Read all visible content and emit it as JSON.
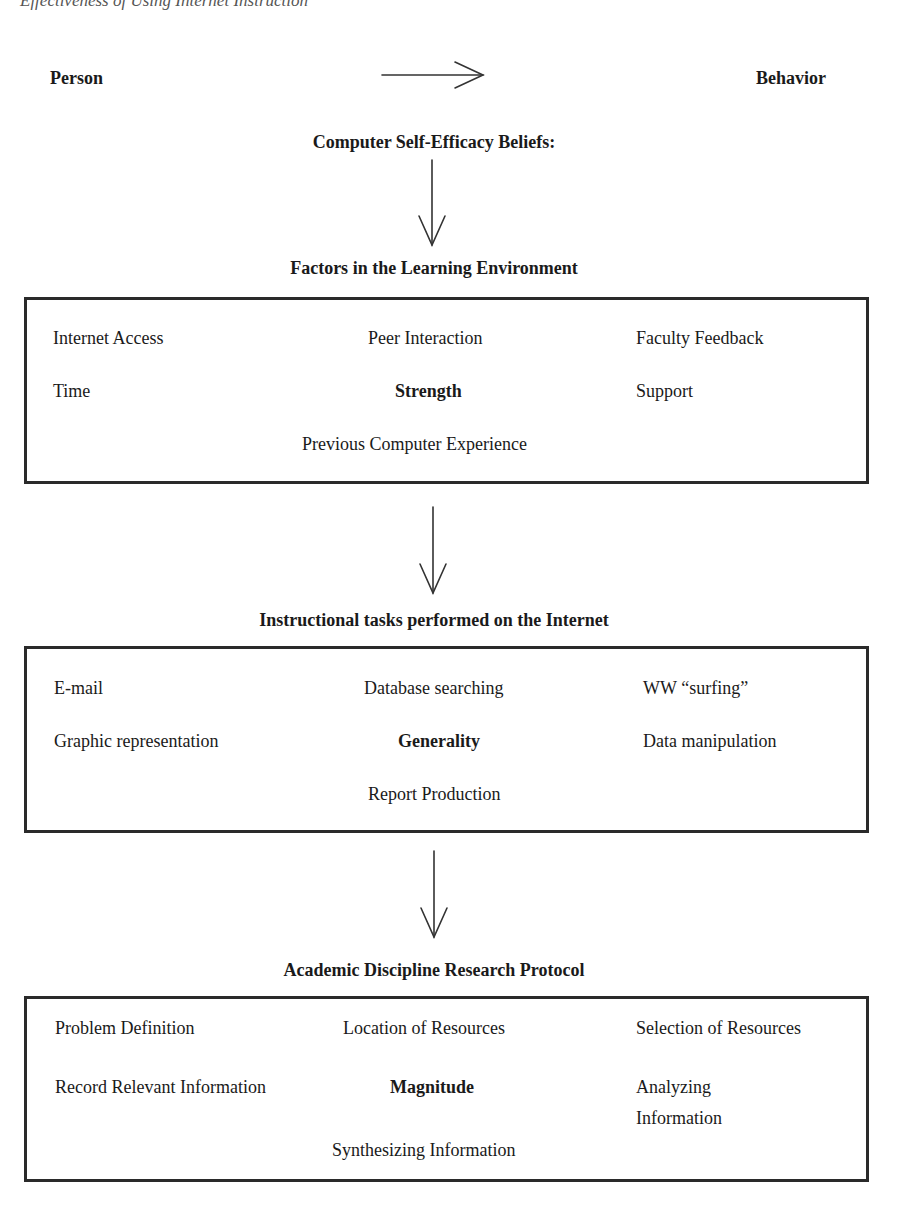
{
  "running_header": {
    "title": "Effectiveness of Using Internet Instruction",
    "page": ""
  },
  "top_row": {
    "left": "Person",
    "right": "Behavior",
    "arrow": "right-arrow-icon"
  },
  "root_heading": "Computer Self-Efficacy Beliefs:",
  "sections": [
    {
      "heading": "Factors in the Learning Environment",
      "dimension": "Strength",
      "items": {
        "r1c1": "Internet Access",
        "r1c2": "Peer Interaction",
        "r1c3": "Faculty Feedback",
        "r2c1": "Time",
        "r2c3": "Support",
        "r3c2": "Previous Computer Experience"
      }
    },
    {
      "heading": "Instructional tasks performed on the Internet",
      "dimension": "Generality",
      "items": {
        "r1c1": "E-mail",
        "r1c2": "Database searching",
        "r1c3": "WW “surfing”",
        "r2c1": "Graphic representation",
        "r2c3": "Data manipulation",
        "r3c2": "Report Production"
      }
    },
    {
      "heading": "Academic Discipline Research Protocol",
      "dimension": "Magnitude",
      "items": {
        "r1c1": "Problem Definition",
        "r1c2": "Location of Resources",
        "r1c3": "Selection of Resources",
        "r2c1": "Record Relevant Information",
        "r2c3a": "Analyzing",
        "r2c3b": "Information",
        "r3c2": "Synthesizing Information"
      }
    }
  ]
}
